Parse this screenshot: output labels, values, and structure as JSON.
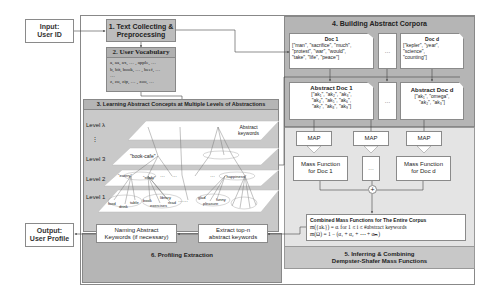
{
  "input": {
    "line1": "Input:",
    "line2": "User ID"
  },
  "output": {
    "line1": "Output:",
    "line2": "User Profile"
  },
  "step1": {
    "line1": "1. Text Collecting &",
    "line2": "Preprocessing"
  },
  "step2": {
    "title": "2. User Vocabulary",
    "lines": [
      "a, aa, ax, … , apple, …",
      "b, bit, book, … , beef, …",
      "…",
      "z, zu, zip, … , zoo, …"
    ]
  },
  "step3": {
    "title": "3. Learning Abstract Concepts at Multiple Levels of Abstractions",
    "levels": [
      "Level λ",
      "⋮",
      "Level 3",
      "Level 2",
      "Level 1"
    ],
    "abstract_label": [
      "Abstract",
      "keywords"
    ],
    "level3_nodes": [
      "\"book-cafe\""
    ],
    "level2_nodes": [
      "\"eatery\"",
      "\"study\"",
      "…",
      "…",
      "…",
      "\"happiness\""
    ],
    "level1_nodes": [
      "food",
      "drink",
      "table",
      "book",
      "library",
      "exercises",
      "read",
      "……",
      "glad",
      "pleasure",
      "funny"
    ]
  },
  "step4": {
    "title": "4. Building Abstract Corpora",
    "doc1": {
      "title": "Doc 1",
      "lines": [
        "[\"man\", \"sacrifice\", \"much\",",
        "\"protest\", \"war\", \"would\",",
        "\"take\", \"life\", \"peace\"]"
      ]
    },
    "docd": {
      "title": "Doc d",
      "lines": [
        "[\"kepler\", \"year\",",
        "\"science\",",
        "\"counting\"]"
      ]
    },
    "ellipsis": "…",
    "absdoc1": {
      "title": "Abstract Doc 1",
      "lines": [
        "[\"ak₁\", \"ak₂\", \"ak₃\",",
        "\"ak₄\", \"ak₅\", \"ak₆\",",
        "\"ak₇\", \"ak₈\", \"ak₉\"]"
      ]
    },
    "absdocd": {
      "title": "Abstract Doc d",
      "lines": [
        "[\"ak₁\", \"omega\",",
        "\"ak₂\", \"ak₃\"]"
      ]
    }
  },
  "step5": {
    "map_label": "MAP",
    "mass1": [
      "Mass Function",
      "for Doc 1"
    ],
    "massd": [
      "Mass Function",
      "for Doc d"
    ],
    "ellipsis": "…",
    "plus": "+",
    "combined_title": "Combined Mass Functions for The Entire Corpus",
    "formula1": "m({akᵢ}) = αᵢ for 1 ≤ i ≤ #abstract keywords",
    "formula2": "m(Ω) = 1 − (α₁ + α₂ + ⋯ + αₘ)",
    "title_line1": "5. Inferring & Combining",
    "title_line2": "Dempster-Shafer Mass Functions"
  },
  "step6": {
    "naming": [
      "Naming Abstract",
      "Keywords (if necessary)"
    ],
    "extract": [
      "Extract top-n",
      "abstract keywords"
    ],
    "title": "6. Profiling Extraction"
  }
}
